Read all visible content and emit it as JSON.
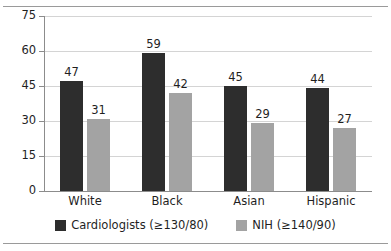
{
  "chart_data": {
    "type": "bar",
    "title": "",
    "subtitle": "",
    "xlabel": "",
    "ylabel": "",
    "categories": [
      "White",
      "Black",
      "Asian",
      "Hispanic"
    ],
    "series": [
      {
        "name": "Cardiologists (≥130/80)",
        "color": "#2d2d2d",
        "values": [
          47,
          59,
          45,
          44
        ]
      },
      {
        "name": "NIH (≥140/90)",
        "color": "#a3a3a3",
        "values": [
          31,
          42,
          29,
          27
        ]
      }
    ],
    "ylim": [
      0,
      75
    ],
    "yticks": [
      0,
      15,
      30,
      45,
      60,
      75
    ],
    "ytick_labels": [
      "0",
      "15",
      "30",
      "45",
      "60",
      "75"
    ],
    "grid": true,
    "grid_axis": "y",
    "data_labels": true,
    "legend_position": "bottom",
    "annotations": []
  },
  "frame": {
    "top_rule_color": "#9a9a9a",
    "bottom_rule_color": "#9a9a9a",
    "background": "#ffffff"
  }
}
